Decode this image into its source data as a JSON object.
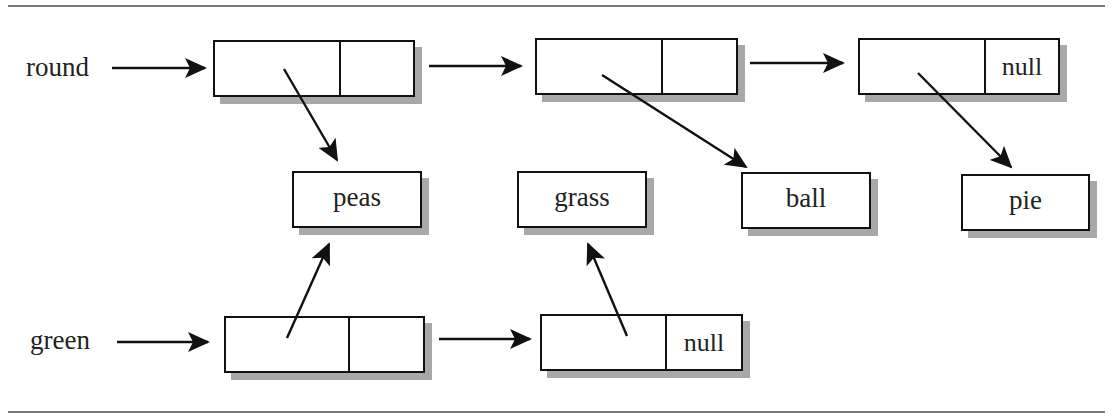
{
  "diagram": {
    "type": "linked-list-shared-values",
    "lists": [
      {
        "name": "round",
        "nodes": [
          {
            "next": "",
            "value": "peas"
          },
          {
            "next": "",
            "value": "ball"
          },
          {
            "next": "null",
            "value": "pie"
          }
        ]
      },
      {
        "name": "green",
        "nodes": [
          {
            "next": "",
            "value": "peas"
          },
          {
            "next": "null",
            "value": "grass"
          }
        ]
      }
    ],
    "values": [
      "peas",
      "grass",
      "ball",
      "pie"
    ]
  },
  "labels": {
    "round": "round",
    "green": "green",
    "null": "null",
    "peas": "peas",
    "grass": "grass",
    "ball": "ball",
    "pie": "pie"
  },
  "colors": {
    "stroke": "#111111",
    "shadow": "#a8a8a8",
    "rule": "#7a7a7a"
  }
}
